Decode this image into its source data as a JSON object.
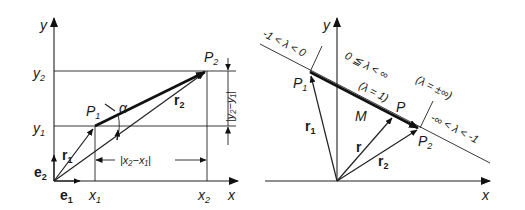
{
  "left_diagram": {
    "axes": {
      "x_label": "x",
      "y_label": "y"
    },
    "unit_vectors": {
      "e1": "e",
      "e1_sub": "1",
      "e2": "e",
      "e2_sub": "2"
    },
    "ticks": {
      "x1": "x",
      "x1_sub": "1",
      "x2": "x",
      "x2_sub": "2",
      "y1": "y",
      "y1_sub": "1",
      "y2": "y",
      "y2_sub": "2"
    },
    "points": {
      "P1": "P",
      "P1_sub": "1",
      "P2": "P",
      "P2_sub": "2"
    },
    "vectors": {
      "r1": "r",
      "r1_sub": "1",
      "r2": "r",
      "r2_sub": "2"
    },
    "angle": "α",
    "dim_x": "|x₂−x₁|",
    "dim_y": "|y₂−y₁|"
  },
  "right_diagram": {
    "axes": {
      "x_label": "x",
      "y_label": "y"
    },
    "points": {
      "P1": "P",
      "P1_sub": "1",
      "P2": "P",
      "P2_sub": "2",
      "P": "P",
      "M": "M"
    },
    "vectors": {
      "r1": "r",
      "r1_sub": "1",
      "r2": "r",
      "r2_sub": "2",
      "r": "r"
    },
    "ranges": {
      "left": "-1 < λ < 0",
      "middle": "0 ≦ λ < ∞",
      "lambda_one": "(λ = 1)",
      "lambda_inf": "(λ = ±∞)",
      "right": "-∞ < λ < -1"
    }
  }
}
